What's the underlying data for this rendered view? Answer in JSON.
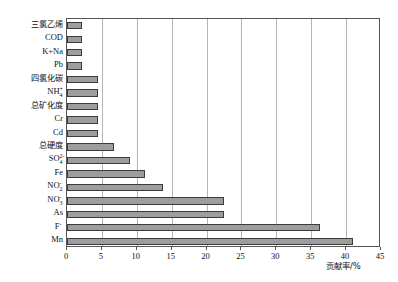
{
  "chart_data": {
    "type": "bar",
    "orientation": "horizontal",
    "title": "",
    "xlabel": "贡献率/%",
    "ylabel": "",
    "xlim": [
      0,
      45
    ],
    "xticks": [
      0,
      5,
      10,
      15,
      20,
      25,
      30,
      35,
      40,
      45
    ],
    "grid": true,
    "legend": "none",
    "categories": [
      "三氯乙烯",
      "COD",
      "K+Na",
      "Pb",
      "四氯化碳",
      "NH4+",
      "总矿化度",
      "Cr",
      "Cd",
      "总硬度",
      "SO42-",
      "Fe",
      "NO2-",
      "NO3-",
      "As",
      "F-",
      "Mn"
    ],
    "category_labels": [
      {
        "base": "三氯乙烯",
        "sub": "",
        "sup": "",
        "cjk": true
      },
      {
        "base": "COD",
        "sub": "",
        "sup": "",
        "cjk": false
      },
      {
        "base": "K+Na",
        "sub": "",
        "sup": "",
        "cjk": false
      },
      {
        "base": "Pb",
        "sub": "",
        "sup": "",
        "cjk": false
      },
      {
        "base": "四氯化碳",
        "sub": "",
        "sup": "",
        "cjk": true
      },
      {
        "base": "NH",
        "sub": "4",
        "sup": "+",
        "cjk": false
      },
      {
        "base": "总矿化度",
        "sub": "",
        "sup": "",
        "cjk": true
      },
      {
        "base": "Cr",
        "sub": "",
        "sup": "",
        "cjk": false
      },
      {
        "base": "Cd",
        "sub": "",
        "sup": "",
        "cjk": false
      },
      {
        "base": "总硬度",
        "sub": "",
        "sup": "",
        "cjk": true
      },
      {
        "base": "SO",
        "sub": "4",
        "sup": "2-",
        "cjk": false
      },
      {
        "base": "Fe",
        "sub": "",
        "sup": "",
        "cjk": false
      },
      {
        "base": "NO",
        "sub": "2",
        "sup": "-",
        "cjk": false
      },
      {
        "base": "NO",
        "sub": "3",
        "sup": "-",
        "cjk": false
      },
      {
        "base": "As",
        "sub": "",
        "sup": "",
        "cjk": false
      },
      {
        "base": "F",
        "sub": "",
        "sup": "-",
        "cjk": false
      },
      {
        "base": "Mn",
        "sub": "",
        "sup": "",
        "cjk": false
      }
    ],
    "values": [
      2.2,
      2.2,
      2.2,
      2.2,
      4.5,
      4.5,
      4.5,
      4.5,
      4.5,
      6.8,
      9.0,
      11.2,
      13.8,
      22.5,
      22.5,
      36.2,
      41.0
    ],
    "bar_color": "#9d9d9d",
    "bar_edge_color": "#3c3c3c",
    "grid_color": "#b4b4b4",
    "axis_color": "#555555"
  }
}
